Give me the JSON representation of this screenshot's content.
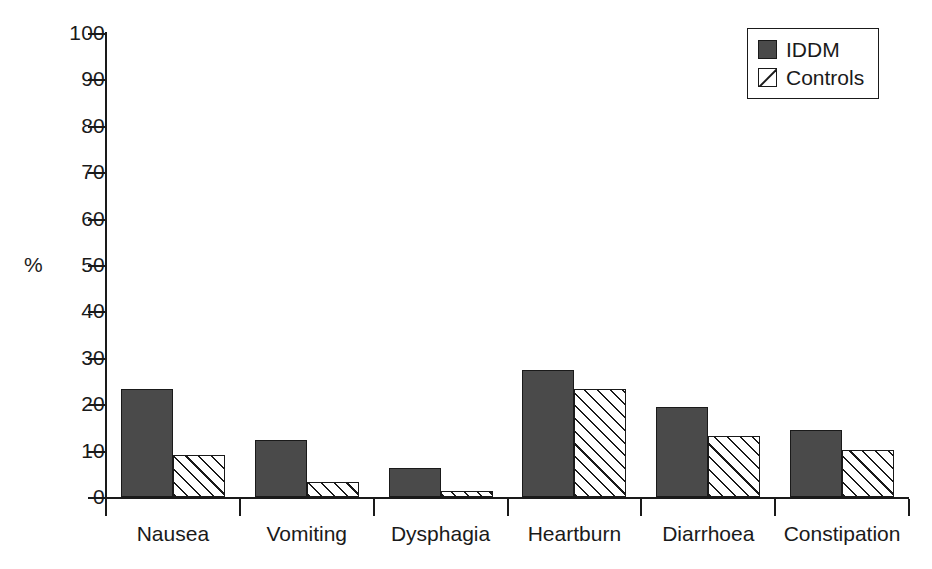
{
  "chart_data": {
    "type": "bar",
    "title": "",
    "xlabel": "",
    "ylabel": "%",
    "ylim": [
      0,
      100
    ],
    "yticks": [
      0,
      10,
      20,
      30,
      40,
      50,
      60,
      70,
      80,
      90,
      100
    ],
    "ytick_labels": [
      "0",
      "10",
      "20",
      "30",
      "40",
      "50",
      "60",
      "70",
      "80",
      "90",
      "100"
    ],
    "grid": false,
    "legend_position": "top-right",
    "categories": [
      "Nausea",
      "Vomiting",
      "Dysphagia",
      "Heartburn",
      "Diarrhoea",
      "Constipation"
    ],
    "series": [
      {
        "name": "IDDM",
        "fill": "solid",
        "color": "#4a4a4a",
        "values": [
          23.3,
          12.3,
          6.2,
          27.3,
          19.4,
          14.4
        ]
      },
      {
        "name": "Controls",
        "fill": "hatched",
        "color": "#ffffff",
        "values": [
          9.1,
          3.3,
          1.2,
          23.3,
          13.2,
          10.2
        ]
      }
    ]
  },
  "legend": {
    "items": [
      {
        "label": "IDDM"
      },
      {
        "label": "Controls"
      }
    ]
  },
  "colors": {
    "axis": "#1a1a1a",
    "iddm_fill": "#4a4a4a",
    "controls_fill": "#ffffff",
    "background": "#ffffff"
  }
}
